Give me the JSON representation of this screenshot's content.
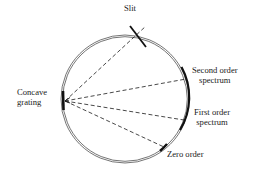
{
  "diagram": {
    "type": "Rowland circle / concave grating spectrograph",
    "colors": {
      "background": "#ffffff",
      "ink": "#1a1a1a",
      "circle": "#3a3a3a"
    },
    "labels": {
      "slit": "Slit",
      "grating_line1": "Concave",
      "grating_line2": "grating",
      "second_order_line1": "Second order",
      "second_order_line2": "spectrum",
      "first_order_line1": "First order",
      "first_order_line2": "spectrum",
      "zero_order": "Zero order"
    },
    "elements": [
      {
        "name": "rowland-circle",
        "shape": "double circle"
      },
      {
        "name": "slit",
        "shape": "short thick line crossing circle at top"
      },
      {
        "name": "concave-grating",
        "shape": "thick vertical bar on left of circle"
      },
      {
        "name": "spectrum-arc",
        "shape": "thick arc on right side covering first and second order"
      },
      {
        "name": "zero-order-mark",
        "shape": "thick short arc at lower right"
      }
    ],
    "rays": [
      {
        "from": "concave-grating",
        "to": "slit",
        "style": "dashed"
      },
      {
        "from": "concave-grating",
        "to": "second-order-spectrum",
        "style": "dashed"
      },
      {
        "from": "concave-grating",
        "to": "first-order-spectrum",
        "style": "dashed"
      },
      {
        "from": "concave-grating",
        "to": "zero-order",
        "style": "dashed"
      }
    ]
  }
}
